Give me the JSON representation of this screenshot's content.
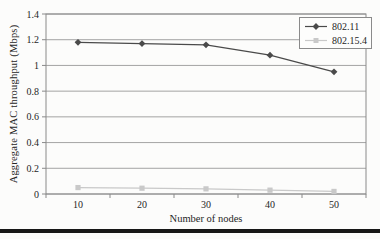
{
  "chart_data": {
    "type": "line",
    "title": "",
    "xlabel": "Number of nodes",
    "ylabel": "Aggregate MAC throughput (Mbps)",
    "categories": [
      "10",
      "20",
      "30",
      "40",
      "50"
    ],
    "series": [
      {
        "name": "802.11",
        "marker": "diamond",
        "color": "#4a4a4a",
        "values": [
          1.18,
          1.17,
          1.16,
          1.08,
          0.95
        ]
      },
      {
        "name": "802.15.4",
        "marker": "square",
        "color": "#c9c9c9",
        "values": [
          0.05,
          0.045,
          0.04,
          0.03,
          0.02
        ]
      }
    ],
    "ylim": [
      0,
      1.4
    ],
    "ytick_values": [
      0,
      0.2,
      0.4,
      0.6,
      0.8,
      1,
      1.2,
      1.4
    ],
    "ytick_labels": [
      "0",
      "0.2",
      "0.4",
      "0.6",
      "0.8",
      "1",
      "1.2",
      "1.4"
    ],
    "grid": "horizontal",
    "legend_position": "top-right",
    "colors": {
      "axis": "#8a8a8a",
      "grid": "#9a9a9a",
      "text": "#262626",
      "legend_background": "#fdfdfc",
      "page_background": "#fcfcfb",
      "bottom_rule": "#171717"
    }
  }
}
